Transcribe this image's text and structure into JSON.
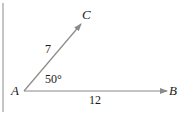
{
  "diagram": {
    "type": "vector-angle",
    "points": {
      "origin": "A",
      "end1": "B",
      "end2": "C"
    },
    "labels": {
      "A": "A",
      "B": "B",
      "C": "C",
      "side_AC": "7",
      "side_AB": "12",
      "angle": "50°"
    },
    "colors": {
      "arrow": "#8a8a8a",
      "text": "#1a1a1a",
      "border": "#8a8a8a"
    }
  }
}
